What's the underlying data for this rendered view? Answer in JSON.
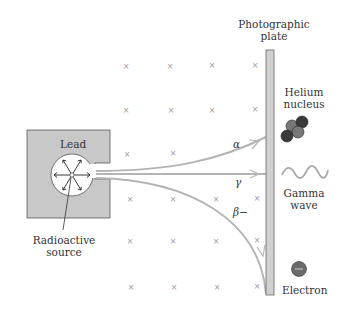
{
  "diagram": {
    "labels": {
      "plate_line1": "Photographic",
      "plate_line2": "plate",
      "lead": "Lead",
      "source_line1": "Radioactive",
      "source_line2": "source",
      "helium_line1": "Helium",
      "helium_line2": "nucleus",
      "gamma_line1": "Gamma",
      "gamma_line2": "wave",
      "electron": "Electron"
    },
    "rays": [
      {
        "name": "alpha",
        "symbol": "α",
        "curve": "up"
      },
      {
        "name": "gamma",
        "symbol": "γ",
        "curve": "straight"
      },
      {
        "name": "beta",
        "symbol": "β−",
        "curve": "down"
      }
    ],
    "field_marker": "×",
    "colors": {
      "lead_fill": "#c8c8c8",
      "ray": "#b4b4b4",
      "plate": "#d0d0d0",
      "particle_dark": "#3a3a3a",
      "particle_mid": "#777777",
      "text": "#333333"
    }
  }
}
